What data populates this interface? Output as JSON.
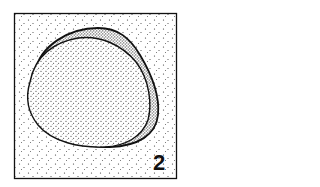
{
  "figure": {
    "label": "2",
    "colors": {
      "ink": "#111111",
      "paper": "#ffffff"
    },
    "elements": [
      "frame",
      "background-stipple",
      "outer-rim",
      "inner-body"
    ]
  }
}
